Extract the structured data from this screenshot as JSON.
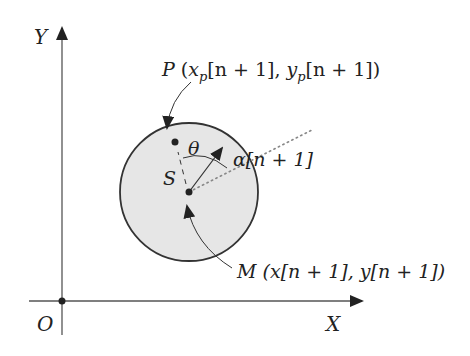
{
  "diagram": {
    "axes": {
      "x_label": "X",
      "y_label": "Y",
      "origin_label": "O"
    },
    "circle": {
      "fill": "#e6e6e6",
      "stroke": "#333333"
    },
    "labels": {
      "point_p": {
        "name": "P",
        "open": " (",
        "x": "x",
        "x_sub": "p",
        "x_idx": "[n + 1], ",
        "y": "y",
        "y_sub": "p",
        "y_idx": "[n + 1])"
      },
      "point_m": {
        "name": "M",
        "coords": " (x[n + 1], y[n + 1])"
      },
      "angle_theta": "θ",
      "angle_alpha": "α[n + 1]",
      "point_s": "S"
    },
    "colors": {
      "line": "#333333",
      "text": "#222222",
      "dotted": "#888888"
    }
  }
}
